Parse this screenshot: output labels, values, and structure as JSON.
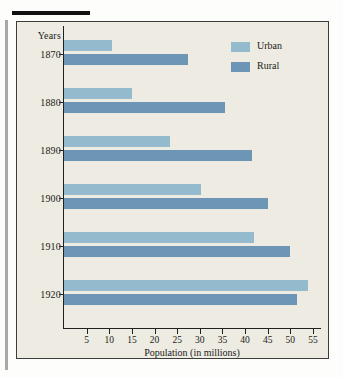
{
  "chart_data": {
    "type": "bar",
    "orientation": "horizontal",
    "title": "",
    "xlabel": "Population (in millions)",
    "ylabel": "Years",
    "categories": [
      "1870",
      "1880",
      "1890",
      "1900",
      "1910",
      "1920"
    ],
    "series": [
      {
        "name": "Urban",
        "color": "#93bacd",
        "values": [
          10.5,
          15.0,
          23.5,
          30.3,
          42.0,
          54.0
        ]
      },
      {
        "name": "Rural",
        "color": "#6d95b6",
        "values": [
          27.5,
          35.5,
          41.5,
          45.0,
          50.0,
          51.5
        ]
      }
    ],
    "xlim": [
      0,
      57
    ],
    "xticks": [
      5,
      10,
      15,
      20,
      25,
      30,
      35,
      40,
      45,
      50,
      55
    ],
    "grid": false,
    "legend_position": "top-right"
  },
  "legend": {
    "entries": [
      {
        "label": "Urban",
        "swatch": "urban"
      },
      {
        "label": "Rural",
        "swatch": "rural"
      }
    ]
  },
  "axes": {
    "years_caption": "Years",
    "x_title": "Population (in millions)"
  }
}
